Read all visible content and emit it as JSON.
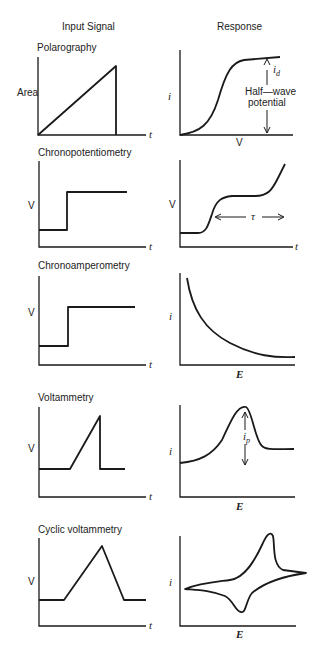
{
  "headers": {
    "input": "Input Signal",
    "response": "Response"
  },
  "techniques": [
    {
      "name": "Polarography",
      "input_ylabel": "Area",
      "input_xlabel": "t",
      "response_ylabel": "i",
      "response_xlabel": "V",
      "annotations": {
        "id_main": "i",
        "id_sub": "d",
        "half_wave_1": "Half—wave",
        "half_wave_2": "potential"
      }
    },
    {
      "name": "Chronopotentiometry",
      "input_ylabel": "V",
      "input_xlabel": "t",
      "response_ylabel": "V",
      "response_xlabel": "t",
      "annotations": {
        "tau": "τ"
      }
    },
    {
      "name": "Chronoamperometry",
      "input_ylabel": "V",
      "input_xlabel": "t",
      "response_ylabel": "i",
      "response_xlabel": "E"
    },
    {
      "name": "Voltammetry",
      "input_ylabel": "V",
      "input_xlabel": "t",
      "response_ylabel": "i",
      "response_xlabel": "E",
      "annotations": {
        "ip_main": "i",
        "ip_sub": "p"
      }
    },
    {
      "name": "Cyclic voltammetry",
      "input_ylabel": "V",
      "input_xlabel": "t",
      "response_ylabel": "i",
      "response_xlabel": "E"
    }
  ]
}
